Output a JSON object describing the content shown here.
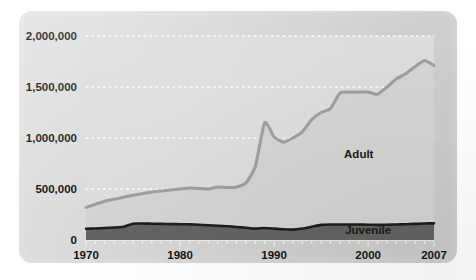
{
  "chart_data": {
    "type": "area",
    "title": "",
    "subtitle": "",
    "xlabel": "",
    "ylabel": "",
    "grid": "horizontal-dotted",
    "legend_position": "inline-annotations",
    "xlim": [
      1970,
      2007
    ],
    "ylim": [
      0,
      2000000
    ],
    "x_ticks": [
      1970,
      1980,
      1990,
      2000,
      2007
    ],
    "x_tick_labels": [
      "1970",
      "1980",
      "1990",
      "2000",
      "2007"
    ],
    "y_ticks": [
      0,
      500000,
      1000000,
      1500000,
      2000000
    ],
    "y_tick_labels": [
      "0",
      "500,000",
      "1,000,000",
      "1,500,000",
      "2,000,000"
    ],
    "annotations": [
      {
        "text": "Adult",
        "x": 1999,
        "y": 800000
      },
      {
        "text": "Juvenile",
        "x": 2000,
        "y": 55000
      }
    ],
    "colors": {
      "adult_line": "#9d9d9c",
      "adult_fill": "#d3d3d2",
      "juvenile_fill": "#636362",
      "juvenile_line": "#1d1d1c",
      "panel_background": "#d6d6d5",
      "plot_background": "#dcdcdb",
      "gridline": "#fdfdfd",
      "text": "#141414"
    },
    "x": [
      1970,
      1971,
      1972,
      1973,
      1974,
      1975,
      1976,
      1977,
      1978,
      1979,
      1980,
      1981,
      1982,
      1983,
      1984,
      1985,
      1986,
      1987,
      1988,
      1989,
      1990,
      1991,
      1992,
      1993,
      1994,
      1995,
      1996,
      1997,
      1998,
      1999,
      2000,
      2001,
      2002,
      2003,
      2004,
      2005,
      2006,
      2007
    ],
    "series": [
      {
        "name": "Adult",
        "values": [
          320000,
          350000,
          380000,
          400000,
          420000,
          440000,
          455000,
          470000,
          480000,
          490000,
          500000,
          510000,
          505000,
          500000,
          520000,
          515000,
          520000,
          560000,
          720000,
          1150000,
          1010000,
          960000,
          1000000,
          1060000,
          1180000,
          1250000,
          1290000,
          1440000,
          1450000,
          1450000,
          1450000,
          1430000,
          1500000,
          1580000,
          1630000,
          1700000,
          1760000,
          1710000
        ]
      },
      {
        "name": "Juvenile",
        "values": [
          110000,
          113000,
          118000,
          122000,
          130000,
          160000,
          162000,
          160000,
          158000,
          156000,
          155000,
          153000,
          150000,
          145000,
          140000,
          135000,
          128000,
          120000,
          112000,
          118000,
          112000,
          105000,
          102000,
          112000,
          130000,
          148000,
          152000,
          152000,
          152000,
          152000,
          150000,
          148000,
          150000,
          152000,
          155000,
          158000,
          162000,
          163000
        ]
      }
    ]
  }
}
